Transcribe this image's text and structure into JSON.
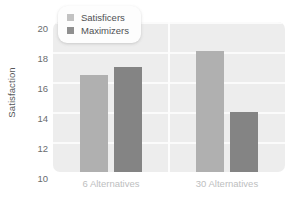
{
  "chart_data": {
    "type": "bar",
    "title": "",
    "xlabel": "",
    "ylabel": "Satisfaction",
    "categories": [
      "6 Alternatives",
      "30 Alternatives"
    ],
    "series": [
      {
        "name": "Satisficers",
        "values": [
          16.5,
          18.1
        ],
        "color": "#b0b0b0"
      },
      {
        "name": "Maximizers",
        "values": [
          17.0,
          14.0
        ],
        "color": "#848484"
      }
    ],
    "ylim": [
      10,
      20
    ],
    "yticks": [
      20,
      18,
      16,
      14,
      12,
      10
    ],
    "ytick_labels": [
      "20",
      "18",
      "16",
      "14",
      "12",
      "10"
    ],
    "grid": true,
    "legend_position": "top-left",
    "panel_color": "#ededed",
    "gridline_color": "#fbfbfb"
  },
  "legend": {
    "items": [
      {
        "label": "Satisficers"
      },
      {
        "label": "Maximizers"
      }
    ]
  }
}
